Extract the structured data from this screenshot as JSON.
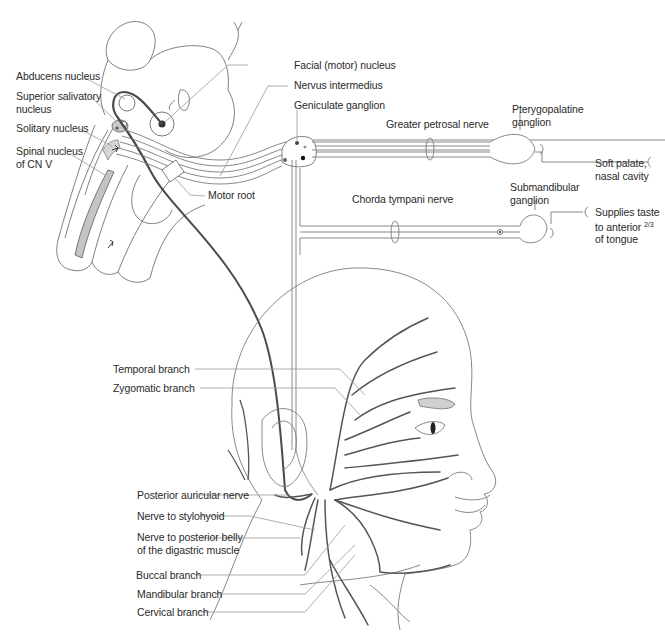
{
  "diagram": {
    "colors": {
      "background": "#ffffff",
      "outline": "#6e6e6e",
      "nerve_motor": "#4a4a4a",
      "nerve_light": "#8c8c8c",
      "leader_line": "#9a9a9a",
      "nucleus_fill": "#c8c8c8",
      "text": "#2a2a2a"
    },
    "labels": {
      "abducens_nucleus": "Abducens nucleus",
      "superior_salivatory_nucleus_1": "Superior salivatory",
      "superior_salivatory_nucleus_2": "nucleus",
      "solitary_nucleus": "Solitary nucleus",
      "spinal_nucleus_1": "Spinal nucleus",
      "spinal_nucleus_2": "of CN V",
      "facial_motor_nucleus": "Facial (motor) nucleus",
      "nervus_intermedius": "Nervus intermedius",
      "geniculate_ganglion": "Geniculate ganglion",
      "greater_petrosal_nerve": "Greater petrosal nerve",
      "pterygopalatine_ganglion_1": "Pterygopalatine",
      "pterygopalatine_ganglion_2": "ganglion",
      "soft_palate_1": "Soft palate,",
      "soft_palate_2": "nasal cavity",
      "motor_root": "Motor root",
      "chorda_tympani_nerve": "Chorda tympani nerve",
      "submandibular_ganglion_1": "Submandibular",
      "submandibular_ganglion_2": "ganglion",
      "supplies_taste_1": "Supplies taste",
      "supplies_taste_2_prefix": "to anterior ",
      "supplies_taste_2_fraction": "2/3",
      "supplies_taste_3": "of tongue",
      "temporal_branch": "Temporal branch",
      "zygomatic_branch": "Zygomatic branch",
      "posterior_auricular_nerve": "Posterior auricular nerve",
      "nerve_to_stylohyoid": "Nerve to stylohyoid",
      "nerve_to_digastric_1": "Nerve to posterior belly",
      "nerve_to_digastric_2": "of the digastric muscle",
      "buccal_branch": "Buccal branch",
      "mandibular_branch": "Mandibular branch",
      "cervical_branch": "Cervical branch"
    }
  }
}
